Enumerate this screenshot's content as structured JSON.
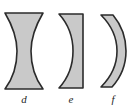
{
  "figure": {
    "kind": "optics-diagram",
    "width": 134,
    "height": 111,
    "background_color": "#ffffff",
    "fill_color": "#c9c9c9",
    "outline_color": "#2b2b2b",
    "label_color": "#1f1f1f"
  },
  "lenses": [
    {
      "id": "d",
      "label": "d",
      "name": "biconcave-lens",
      "type": "biconcave",
      "description": "Both surfaces concave; flat top and bottom edges with a narrow waist",
      "bounds": {
        "x": 4,
        "y": 12,
        "width": 40,
        "height": 78
      },
      "path": "M 5 13 L 43 13 C 33 30 31 42 31 51 C 31 64 34 77 43 89 L 5 89 C 14 77 17 64 17 51 C 17 42 15 30 5 13 Z"
    },
    {
      "id": "e",
      "label": "e",
      "name": "plano-concave-lens",
      "type": "plano-concave",
      "description": "Flat right surface, concave left surface",
      "bounds": {
        "x": 58,
        "y": 13,
        "width": 26,
        "height": 76
      },
      "path": "M 59 14 L 83 14 L 83 88 L 59 88 C 70 76 73 64 73 51 C 73 37 69 25 59 14 Z"
    },
    {
      "id": "f",
      "label": "f",
      "name": "meniscus-lens",
      "type": "negative-meniscus",
      "description": "Crescent-shaped band; both surfaces curve the same direction",
      "bounds": {
        "x": 100,
        "y": 14,
        "width": 26,
        "height": 74
      },
      "path": "M 101 15 L 113 15 C 123 27 126 39 126 51 C 126 64 122 76 112 87 L 101 87 C 113 75 117 63 117 51 C 117 38 112 26 101 15 Z"
    }
  ]
}
